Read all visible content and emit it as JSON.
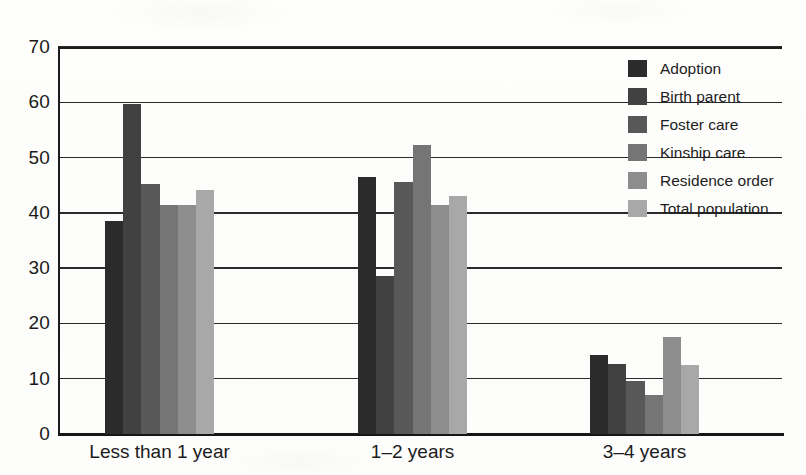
{
  "chart_data": {
    "type": "bar",
    "title": "",
    "subtitle": "",
    "xlabel": "",
    "ylabel": "",
    "ylim": [
      0,
      70
    ],
    "ytick_step": 10,
    "yticks": [
      "70",
      "60",
      "50",
      "40",
      "30",
      "20",
      "10",
      "0"
    ],
    "grid": true,
    "grid_axis": "y",
    "legend_position": "top-right-inside",
    "categories": [
      "Less than 1 year",
      "1–2 years",
      "3–4 years"
    ],
    "series": [
      {
        "name": "Adoption",
        "color": "#2b2b2b",
        "values": [
          38.5,
          46.5,
          14.3
        ]
      },
      {
        "name": "Birth parent",
        "color": "#414141",
        "values": [
          59.7,
          28.5,
          12.7
        ]
      },
      {
        "name": "Foster care",
        "color": "#585858",
        "values": [
          45.2,
          45.5,
          9.5
        ]
      },
      {
        "name": "Kinship care",
        "color": "#757575",
        "values": [
          41.5,
          52.2,
          7.0
        ]
      },
      {
        "name": "Residence order",
        "color": "#8d8d8d",
        "values": [
          41.5,
          41.5,
          17.5
        ]
      },
      {
        "name": "Total population",
        "color": "#a8a8a8",
        "values": [
          44.2,
          43.0,
          12.4
        ]
      }
    ]
  },
  "legend": {
    "items": [
      {
        "label": "Adoption"
      },
      {
        "label": "Birth parent"
      },
      {
        "label": "Foster care"
      },
      {
        "label": "Kinship care"
      },
      {
        "label": "Residence order"
      },
      {
        "label": "Total population"
      }
    ]
  },
  "axis": {
    "y_labels": [
      "70",
      "60",
      "50",
      "40",
      "30",
      "20",
      "10",
      "0"
    ],
    "x_labels": [
      "Less than 1 year",
      "1–2 years",
      "3–4 years"
    ]
  }
}
